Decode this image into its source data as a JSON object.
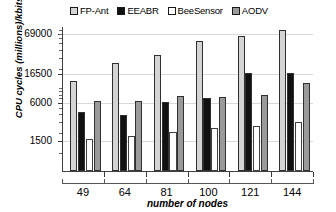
{
  "chart_data": {
    "type": "bar",
    "title": "",
    "xlabel": "number of nodes",
    "ylabel": "CPU cycles (millions)/kbits",
    "categories": [
      "49",
      "64",
      "81",
      "100",
      "121",
      "144"
    ],
    "yticks": [
      1500,
      6000,
      16500,
      69000
    ],
    "ytick_labels": [
      "1500",
      "6000",
      "16500",
      "69000"
    ],
    "yscale": "log",
    "ylim": [
      500,
      90000
    ],
    "grid": true,
    "legend_position": "top",
    "series": [
      {
        "name": "FP-Ant",
        "color": "#d4d4d4",
        "values": [
          12500,
          24000,
          32000,
          52000,
          62000,
          78000
        ]
      },
      {
        "name": "EEABR",
        "color": "#111111",
        "values": [
          4200,
          3700,
          5900,
          6800,
          16500,
          16900
        ]
      },
      {
        "name": "BeeSensor",
        "color": "#ffffff",
        "values": [
          1550,
          1750,
          2000,
          2350,
          2500,
          2900
        ]
      },
      {
        "name": "AODV",
        "color": "#9a9a9a",
        "values": [
          6100,
          6100,
          7400,
          7200,
          7600,
          11500
        ]
      }
    ]
  },
  "legend": {
    "entries": [
      {
        "label": "FP-Ant"
      },
      {
        "label": "EEABR"
      },
      {
        "label": "BeeSensor"
      },
      {
        "label": "AODV"
      }
    ]
  },
  "axes": {
    "y_title": "CPU cycles (millions)/kbits",
    "x_title": "number of nodes"
  }
}
